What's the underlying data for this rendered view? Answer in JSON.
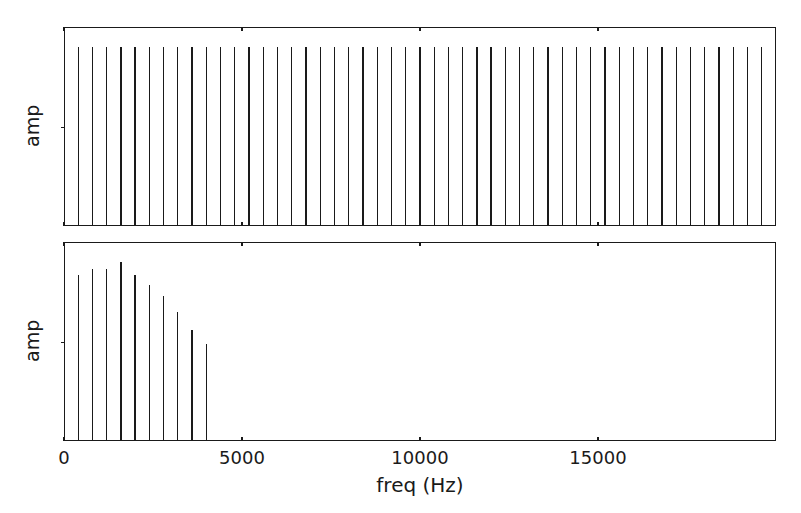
{
  "figure": {
    "background_color": "#ffffff",
    "line_color": "#1a1a1a",
    "width": 801,
    "height": 513
  },
  "xlabel": "freq (Hz)",
  "xtick_labels": [
    "0",
    "5000",
    "10000",
    "15000"
  ],
  "xtick_values": [
    0,
    5000,
    10000,
    15000
  ],
  "panels": [
    {
      "ylabel": "amp"
    },
    {
      "ylabel": "amp"
    }
  ],
  "chart_data": [
    {
      "type": "bar",
      "title": "",
      "subtitle": "aliased sawtooth spectrum (upper panel)",
      "xlabel": "",
      "ylabel": "amp",
      "xlim": [
        0,
        20000
      ],
      "ylim": [
        0,
        1.12
      ],
      "grid": false,
      "legend": "none",
      "xtick_labels": [
        "0",
        "5000",
        "10000",
        "15000"
      ],
      "xtick_values": [
        0,
        5000,
        10000,
        15000
      ],
      "annotations": [
        "all partials equal amplitude across full band (aliasing)"
      ],
      "x": [
        370,
        770,
        1170,
        1570,
        1970,
        2370,
        2770,
        3170,
        3570,
        3970,
        4370,
        4770,
        5170,
        5570,
        5970,
        6370,
        6770,
        7170,
        7570,
        7970,
        8370,
        8770,
        9170,
        9570,
        9970,
        10370,
        10770,
        11170,
        11570,
        11970,
        12370,
        12770,
        13170,
        13570,
        13970,
        14370,
        14770,
        15170,
        15570,
        15970,
        16370,
        16770,
        17170,
        17570,
        17970,
        18370,
        18770,
        19170,
        19570
      ],
      "values": [
        1.0,
        1.0,
        1.0,
        1.0,
        1.0,
        1.0,
        1.0,
        1.0,
        1.0,
        1.0,
        1.0,
        1.0,
        1.0,
        1.0,
        1.0,
        1.0,
        1.0,
        1.0,
        1.0,
        1.0,
        1.0,
        1.0,
        1.0,
        1.0,
        1.0,
        1.0,
        1.0,
        1.0,
        1.0,
        1.0,
        1.0,
        1.0,
        1.0,
        1.0,
        1.0,
        1.0,
        1.0,
        1.0,
        1.0,
        1.0,
        1.0,
        1.0,
        1.0,
        1.0,
        1.0,
        1.0,
        1.0,
        1.0,
        1.0
      ]
    },
    {
      "type": "bar",
      "title": "",
      "subtitle": "band-limited sawtooth spectrum (lower panel)",
      "xlabel": "freq (Hz)",
      "ylabel": "amp",
      "xlim": [
        0,
        20000
      ],
      "ylim": [
        0,
        1.12
      ],
      "grid": false,
      "legend": "none",
      "xtick_labels": [
        "0",
        "5000",
        "10000",
        "15000"
      ],
      "xtick_values": [
        0,
        5000,
        10000,
        15000
      ],
      "annotations": [
        "partials roll off as 1/n and stop near 4000 Hz"
      ],
      "x": [
        370,
        770,
        1170,
        1570,
        1970,
        2370,
        2770,
        3170,
        3570,
        3970
      ],
      "values": [
        0.93,
        0.96,
        0.96,
        1.0,
        0.93,
        0.87,
        0.81,
        0.72,
        0.62,
        0.54
      ]
    }
  ]
}
